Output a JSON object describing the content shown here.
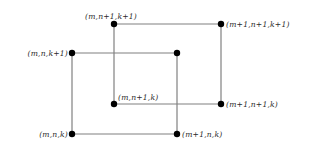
{
  "figure": {
    "name": "cubic-lattice-cell",
    "width": 312,
    "height": 150,
    "background_color": "#ffffff",
    "edge_color": "#808080",
    "vertex_color": "#000000",
    "label_color": "#2b2b2b",
    "edge_width": 1.2,
    "vertex_radius": 3.2
  },
  "vertices": [
    {
      "id": "front-bottom-left",
      "label": "(m,n,k)",
      "x": 72,
      "y": 134,
      "label_x": 68,
      "label_y": 131,
      "label_anchor": "right"
    },
    {
      "id": "front-bottom-right",
      "label": "(m+1,n,k)",
      "x": 177,
      "y": 134,
      "label_x": 182,
      "label_y": 131,
      "label_anchor": "left"
    },
    {
      "id": "front-top-left",
      "label": "(m,n,k+1)",
      "x": 72,
      "y": 53,
      "label_x": 68,
      "label_y": 50,
      "label_anchor": "right"
    },
    {
      "id": "front-top-right",
      "label": "",
      "x": 177,
      "y": 53,
      "label_x": 182,
      "label_y": 50,
      "label_anchor": "left"
    },
    {
      "id": "back-bottom-left",
      "label": "(m,n+1,k)",
      "x": 114,
      "y": 104,
      "label_x": 118,
      "label_y": 94,
      "label_anchor": "left"
    },
    {
      "id": "back-bottom-right",
      "label": "(m+1,n+1,k)",
      "x": 221,
      "y": 104,
      "label_x": 226,
      "label_y": 101,
      "label_anchor": "left"
    },
    {
      "id": "back-top-left",
      "label": "(m,n+1,k+1)",
      "x": 114,
      "y": 24,
      "label_x": 111,
      "label_y": 13,
      "label_anchor": "center"
    },
    {
      "id": "back-top-right",
      "label": "(m+1,n+1,k+1)",
      "x": 221,
      "y": 24,
      "label_x": 226,
      "label_y": 21,
      "label_anchor": "left"
    }
  ],
  "edges": [
    {
      "id": "front-left-vertical",
      "x1": 72,
      "y1": 53,
      "x2": 72,
      "y2": 134
    },
    {
      "id": "front-bottom-horizontal",
      "x1": 72,
      "y1": 134,
      "x2": 177,
      "y2": 134
    },
    {
      "id": "front-right-vertical",
      "x1": 177,
      "y1": 53,
      "x2": 177,
      "y2": 134
    },
    {
      "id": "front-top-horizontal",
      "x1": 72,
      "y1": 53,
      "x2": 177,
      "y2": 53
    },
    {
      "id": "back-left-vertical",
      "x1": 114,
      "y1": 24,
      "x2": 114,
      "y2": 104
    },
    {
      "id": "back-bottom-horizontal",
      "x1": 114,
      "y1": 104,
      "x2": 221,
      "y2": 104
    },
    {
      "id": "back-right-vertical",
      "x1": 221,
      "y1": 24,
      "x2": 221,
      "y2": 104
    },
    {
      "id": "back-top-horizontal",
      "x1": 114,
      "y1": 24,
      "x2": 221,
      "y2": 24
    }
  ]
}
